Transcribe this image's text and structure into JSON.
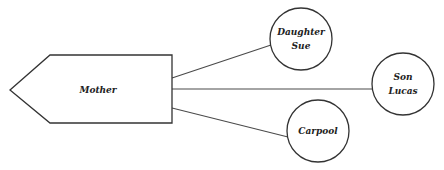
{
  "diagram": {
    "center": {
      "label": "Mother"
    },
    "nodes": [
      {
        "id": "daughter",
        "lines": [
          "Daughter",
          "Sue"
        ]
      },
      {
        "id": "son",
        "lines": [
          "Son",
          "Lucas"
        ]
      },
      {
        "id": "carpool",
        "lines": [
          "Carpool"
        ]
      }
    ],
    "edges": [
      {
        "from": "Mother",
        "to": "daughter"
      },
      {
        "from": "Mother",
        "to": "son"
      },
      {
        "from": "Mother",
        "to": "carpool"
      }
    ],
    "colors": {
      "stroke": "#333333",
      "background": "#ffffff"
    }
  }
}
